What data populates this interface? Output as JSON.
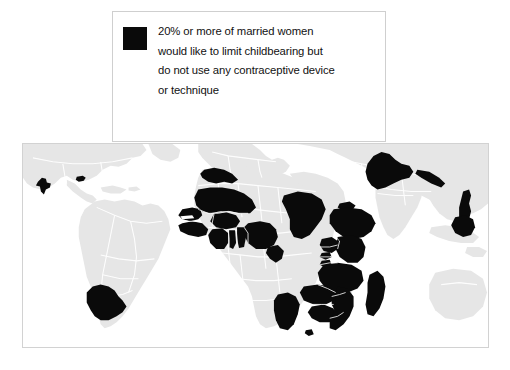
{
  "figure": {
    "background_color": "#ffffff"
  },
  "legend": {
    "swatch_color": "#0a0a0a",
    "swatch_name": "legend-swatch-black",
    "lines": [
      "20% or more of married women",
      "would like to limit childbearing but",
      "do not use any contraceptive device",
      "or technique"
    ],
    "full_text": "20% or more of married women would like to limit childbearing but do not use any contraceptive device or technique"
  },
  "map": {
    "frame_border_color": "#d2d2d2",
    "ocean_color": "#ffffff",
    "land_color": "#e6e6e6",
    "border_color": "#ffffff",
    "highlight_color": "#0a0a0a",
    "highlighted_regions": [
      "Guatemala",
      "Haiti",
      "Bolivia",
      "Morocco",
      "Mali",
      "Senegal",
      "Gambia",
      "Guinea",
      "Burkina Faso",
      "Ghana",
      "Togo",
      "Benin",
      "Nigeria",
      "Chad",
      "Cameroon",
      "Ethiopia",
      "Eritrea",
      "Uganda",
      "Kenya",
      "Rwanda",
      "Burundi",
      "Tanzania",
      "Malawi",
      "Zambia",
      "Zimbabwe",
      "Mozambique",
      "Madagascar",
      "Namibia",
      "Lesotho",
      "Pakistan",
      "Nepal",
      "Vietnam",
      "Cambodia"
    ]
  }
}
